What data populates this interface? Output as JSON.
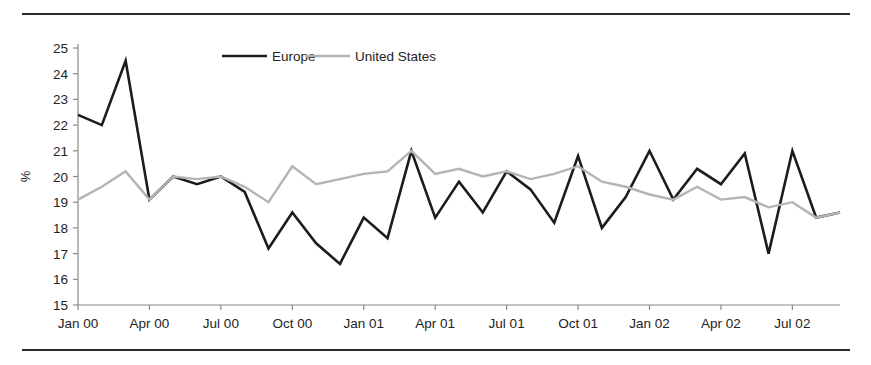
{
  "figure": {
    "top_rule": "horizontal-rule",
    "bottom_rule": "horizontal-rule"
  },
  "chart_data": {
    "type": "line",
    "title": "",
    "xlabel": "",
    "ylabel": "%",
    "ylim": [
      15,
      25
    ],
    "ytick_step": 1,
    "yticks": [
      15,
      16,
      17,
      18,
      19,
      20,
      21,
      22,
      23,
      24,
      25
    ],
    "grid": false,
    "legend_position": "top-center",
    "x": [
      "Jan 00",
      "Feb 00",
      "Mar 00",
      "Apr 00",
      "May 00",
      "Jun 00",
      "Jul 00",
      "Aug 00",
      "Sep 00",
      "Oct 00",
      "Nov 00",
      "Dec 00",
      "Jan 01",
      "Feb 01",
      "Mar 01",
      "Apr 01",
      "May 01",
      "Jun 01",
      "Jul 01",
      "Aug 01",
      "Sep 01",
      "Oct 01",
      "Nov 01",
      "Dec 01",
      "Jan 02",
      "Feb 02",
      "Mar 02",
      "Apr 02",
      "May 02",
      "Jun 02",
      "Jul 02",
      "Aug 02",
      "Sep 02"
    ],
    "xtick_labels": [
      "Jan 00",
      "Apr 00",
      "Jul 00",
      "Oct 00",
      "Jan 01",
      "Apr 01",
      "Jul 01",
      "Oct 01",
      "Jan 02",
      "Apr 02",
      "Jul 02"
    ],
    "xtick_indices": [
      0,
      3,
      6,
      9,
      12,
      15,
      18,
      21,
      24,
      27,
      30
    ],
    "series": [
      {
        "name": "Europe",
        "color": "#1c1c1c",
        "width": 2.6,
        "values": [
          22.4,
          22.0,
          24.5,
          19.1,
          20.0,
          19.7,
          20.0,
          19.4,
          17.2,
          18.6,
          17.4,
          16.6,
          18.4,
          17.6,
          21.0,
          18.4,
          19.8,
          18.6,
          20.2,
          19.5,
          18.2,
          20.8,
          18.0,
          19.2,
          21.0,
          19.1,
          20.3,
          19.7,
          20.9,
          17.0,
          21.0,
          18.4,
          18.6
        ]
      },
      {
        "name": "United States",
        "color": "#b4b4b4",
        "width": 2.4,
        "values": [
          19.1,
          19.6,
          20.2,
          19.1,
          20.0,
          19.9,
          20.0,
          19.6,
          19.0,
          20.4,
          19.7,
          19.9,
          20.1,
          20.2,
          21.0,
          20.1,
          20.3,
          20.0,
          20.2,
          19.9,
          20.1,
          20.4,
          19.8,
          19.6,
          19.3,
          19.1,
          19.6,
          19.1,
          19.2,
          18.8,
          19.0,
          18.4,
          18.6
        ]
      }
    ]
  }
}
